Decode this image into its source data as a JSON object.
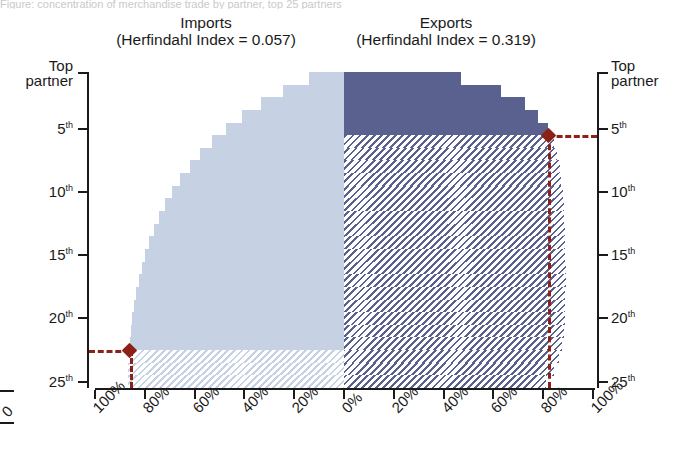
{
  "title_remnant": "Figure: concentration of merchandise trade by partner, top 25 partners",
  "panels": {
    "imports": {
      "name": "Imports",
      "index_label": "(Herfindahl Index = 0.057)"
    },
    "exports": {
      "name": "Exports",
      "index_label": "(Herfindahl Index = 0.319)"
    }
  },
  "axes": {
    "y_left": {
      "top_label_line1": "Top",
      "top_label_line2": "partner",
      "ticks": [
        {
          "value": 5,
          "num": "5",
          "suffix": "th"
        },
        {
          "value": 10,
          "num": "10",
          "suffix": "th"
        },
        {
          "value": 15,
          "num": "15",
          "suffix": "th"
        },
        {
          "value": 20,
          "num": "20",
          "suffix": "th"
        },
        {
          "value": 25,
          "num": "25",
          "suffix": "th"
        }
      ]
    },
    "y_right": {
      "top_label_line1": "Top",
      "top_label_line2": "partner",
      "ticks": [
        {
          "value": 5,
          "num": "5",
          "suffix": "th"
        },
        {
          "value": 10,
          "num": "10",
          "suffix": "th"
        },
        {
          "value": 15,
          "num": "15",
          "suffix": "th"
        },
        {
          "value": 20,
          "num": "20",
          "suffix": "th"
        },
        {
          "value": 25,
          "num": "25",
          "suffix": "th"
        }
      ]
    },
    "x_left": [
      "100%",
      "80%",
      "60%",
      "40%",
      "20%",
      "0%"
    ],
    "x_right": [
      "0%",
      "20%",
      "40%",
      "60%",
      "80%",
      "100%"
    ],
    "x_cut_label": "0"
  },
  "colors": {
    "imports_fill": "#c6d2e4",
    "exports_fill": "#5a618f",
    "marker": "#8c2118",
    "axis": "#1a1a1a"
  },
  "chart_data": {
    "type": "area",
    "subtitle": "Imports (Herfindahl Index = 0.057) / Exports (Herfindahl Index = 0.319)",
    "xlabel": "Cumulative share of trade",
    "ylabel": "Partner rank",
    "xlim": [
      0,
      100
    ],
    "ylim": [
      1,
      25
    ],
    "grid": false,
    "legend_position": "top",
    "orientation": "horizontal-mirrored",
    "note": "Left wing = imports (cumulative share grows leftward from 0% at center); right wing = exports (grows rightward). Hatched portion lies below the highlighted partner-rank marker.",
    "categories": [
      "1st",
      "2nd",
      "3rd",
      "4th",
      "5th",
      "6th",
      "7th",
      "8th",
      "9th",
      "10th",
      "11th",
      "12th",
      "13th",
      "14th",
      "15th",
      "16th",
      "17th",
      "18th",
      "19th",
      "20th",
      "21st",
      "22nd",
      "23rd",
      "24th",
      "25th"
    ],
    "series": [
      {
        "name": "Imports",
        "fill": "#c6d2e4",
        "hatch_below_rank": 22,
        "cumulative_share_pct": [
          14.0,
          24.5,
          33.5,
          41.0,
          47.5,
          53.0,
          57.8,
          62.0,
          65.8,
          69.0,
          71.8,
          74.2,
          76.3,
          78.2,
          79.9,
          81.3,
          82.5,
          83.5,
          84.3,
          85.0,
          85.6,
          86.1,
          86.4,
          86.6,
          86.8
        ]
      },
      {
        "name": "Exports",
        "fill": "#5a618f",
        "hatch_below_rank": 5,
        "cumulative_share_pct": [
          47.0,
          63.0,
          72.5,
          78.0,
          82.0,
          84.2,
          85.6,
          86.6,
          87.3,
          87.8,
          88.2,
          88.5,
          88.7,
          88.85,
          88.95,
          89.0,
          89.0,
          88.95,
          88.85,
          88.6,
          88.2,
          87.5,
          86.4,
          84.5,
          81.0
        ]
      }
    ],
    "annotations": [
      {
        "name": "imports-marker",
        "series": "Imports",
        "rank": 22,
        "rank_label": "22nd",
        "share_pct": 86.1,
        "marker": "diamond",
        "color": "#8c2118"
      },
      {
        "name": "exports-marker",
        "series": "Exports",
        "rank": 5,
        "rank_label": "5th",
        "share_pct": 82.0,
        "marker": "diamond",
        "color": "#8c2118"
      }
    ]
  }
}
